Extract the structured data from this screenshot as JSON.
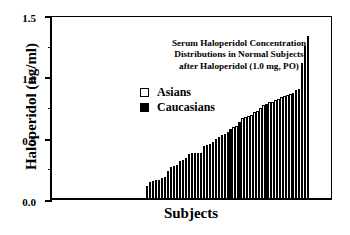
{
  "chart_data": {
    "type": "bar",
    "title_lines": [
      "Serum Haloperidol Concentration",
      "Distributions in Normal Subjects",
      "after Haloperidol (1.0 mg, PO)"
    ],
    "xlabel": "Subjects",
    "ylabel": "Haloperidol (ng/ml)",
    "ylim": [
      0.0,
      1.5
    ],
    "ytick_labels": [
      "0.0",
      "0.5",
      "1.0",
      "1.5"
    ],
    "ytick_values": [
      0.0,
      0.5,
      1.0,
      1.5
    ],
    "yminor_values": [
      0.25,
      0.75,
      1.25
    ],
    "grid": false,
    "legend_position": "upper-left-inside",
    "legend": [
      {
        "label": "Asians",
        "marker": "open-square",
        "color": "#ffffff"
      },
      {
        "label": "Caucasians",
        "marker": "filled-square",
        "color": "#000000"
      }
    ],
    "series": [
      {
        "name": "Asians",
        "color": "#ffffff"
      },
      {
        "name": "Caucasians",
        "color": "#000000"
      }
    ],
    "categories": [
      "1",
      "2",
      "3",
      "4",
      "5",
      "6",
      "7",
      "8",
      "9",
      "10",
      "11",
      "12",
      "13",
      "14",
      "15",
      "16",
      "17",
      "18",
      "19",
      "20",
      "21",
      "22",
      "23",
      "24",
      "25",
      "26",
      "27",
      "28",
      "29",
      "30",
      "31",
      "32",
      "33",
      "34",
      "35",
      "36",
      "37",
      "38",
      "39",
      "40",
      "41",
      "42",
      "43",
      "44",
      "45",
      "46",
      "47",
      "48",
      "49",
      "50",
      "51",
      "52",
      "53",
      "54",
      "55"
    ],
    "values": [
      0.1,
      0.13,
      0.14,
      0.15,
      0.15,
      0.16,
      0.17,
      0.22,
      0.25,
      0.26,
      0.27,
      0.3,
      0.31,
      0.33,
      0.36,
      0.37,
      0.37,
      0.37,
      0.37,
      0.42,
      0.43,
      0.44,
      0.46,
      0.48,
      0.5,
      0.51,
      0.52,
      0.54,
      0.56,
      0.58,
      0.59,
      0.62,
      0.65,
      0.66,
      0.67,
      0.68,
      0.7,
      0.71,
      0.73,
      0.76,
      0.77,
      0.78,
      0.78,
      0.8,
      0.81,
      0.82,
      0.83,
      0.84,
      0.85,
      0.86,
      0.88,
      0.89,
      1.1,
      1.24,
      1.32
    ],
    "groups": [
      "Caucasians",
      "Caucasians",
      "Caucasians",
      "Caucasians",
      "Caucasians",
      "Caucasians",
      "Caucasians",
      "Caucasians",
      "Asians",
      "Asians",
      "Asians",
      "Asians",
      "Caucasians",
      "Asians",
      "Caucasians",
      "Caucasians",
      "Caucasians",
      "Asians",
      "Asians",
      "Asians",
      "Asians",
      "Caucasians",
      "Asians",
      "Asians",
      "Asians",
      "Asians",
      "Caucasians",
      "Asians",
      "Caucasians",
      "Asians",
      "Asians",
      "Caucasians",
      "Asians",
      "Asians",
      "Asians",
      "Asians",
      "Asians",
      "Asians",
      "Asians",
      "Asians",
      "Caucasians",
      "Asians",
      "Asians",
      "Asians",
      "Asians",
      "Asians",
      "Asians",
      "Asians",
      "Asians",
      "Asians",
      "Asians",
      "Asians",
      "Asians",
      "Asians",
      "Asians"
    ]
  }
}
